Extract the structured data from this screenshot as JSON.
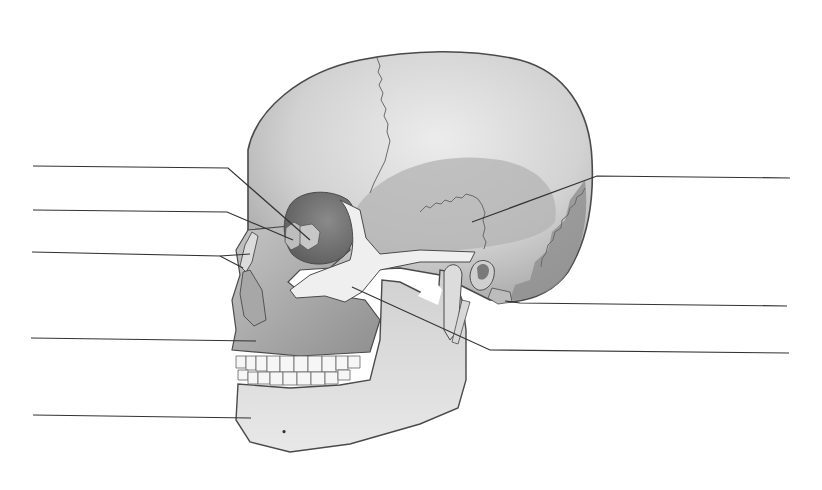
{
  "diagram": {
    "title": "",
    "style": "grayscale anatomical illustration",
    "colors": {
      "background": "#ffffff",
      "bone_light": "#e4e4e4",
      "bone_mid": "#c9c9c9",
      "bone_dark": "#9a9a9a",
      "outline": "#4a4a4a",
      "suture": "#6a6a6a",
      "leader_line": "#333333",
      "teeth": "#f6f6f6"
    },
    "leader_lines": [
      {
        "id": "L1",
        "side": "left",
        "label": "",
        "path": [
          [
            33,
            166
          ],
          [
            228,
            168
          ],
          [
            310,
            240
          ]
        ]
      },
      {
        "id": "L2",
        "side": "left",
        "label": "",
        "path": [
          [
            33,
            210
          ],
          [
            227,
            212
          ],
          [
            293,
            240
          ]
        ]
      },
      {
        "id": "L3",
        "side": "left",
        "label": "",
        "path": [
          [
            32,
            252
          ],
          [
            220,
            256
          ],
          [
            243,
            268
          ]
        ]
      },
      {
        "id": "L4",
        "side": "left",
        "label": "",
        "path": [
          [
            31,
            338
          ],
          [
            256,
            341
          ]
        ]
      },
      {
        "id": "L5",
        "side": "left",
        "label": "",
        "path": [
          [
            33,
            415
          ],
          [
            251,
            418
          ]
        ]
      },
      {
        "id": "R1",
        "side": "right",
        "label": "",
        "path": [
          [
            790,
            178
          ],
          [
            597,
            176
          ],
          [
            472,
            222
          ]
        ]
      },
      {
        "id": "R2",
        "side": "right",
        "label": "",
        "path": [
          [
            787,
            306
          ],
          [
            520,
            303
          ],
          [
            505,
            301
          ]
        ]
      },
      {
        "id": "R3",
        "side": "right",
        "label": "",
        "path": [
          [
            789,
            353
          ],
          [
            490,
            350
          ],
          [
            352,
            287
          ]
        ]
      }
    ]
  }
}
